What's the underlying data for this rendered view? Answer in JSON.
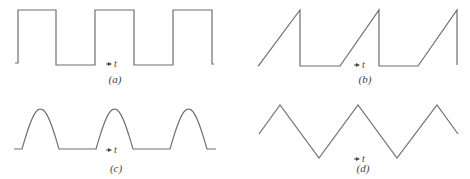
{
  "figure": {
    "panels": [
      {
        "id": "a",
        "label": "(a)",
        "waveform": "square",
        "axis_label": "t",
        "points": [
          [
            15,
            63
          ],
          [
            18,
            63
          ],
          [
            18,
            10
          ],
          [
            56,
            10
          ],
          [
            56,
            65
          ],
          [
            95,
            65
          ],
          [
            95,
            10
          ],
          [
            134,
            10
          ],
          [
            134,
            65
          ],
          [
            173,
            65
          ],
          [
            173,
            10
          ],
          [
            212,
            10
          ],
          [
            212,
            64
          ],
          [
            214,
            64
          ]
        ],
        "arrow": {
          "x1": 106,
          "x2": 112,
          "y": 64
        },
        "t_pos": {
          "x": 114,
          "y": 67
        },
        "label_pos": {
          "x": 115,
          "y": 83
        }
      },
      {
        "id": "b",
        "label": "(b)",
        "waveform": "sawtooth",
        "axis_label": "t",
        "points": [
          [
            258,
            66
          ],
          [
            259,
            65
          ],
          [
            300,
            10
          ],
          [
            300,
            66
          ],
          [
            340,
            66
          ],
          [
            379,
            10
          ],
          [
            379,
            66
          ],
          [
            418,
            66
          ],
          [
            457,
            10
          ],
          [
            457,
            65
          ]
        ],
        "arrow": {
          "x1": 354,
          "x2": 360,
          "y": 65
        },
        "t_pos": {
          "x": 362,
          "y": 68
        },
        "label_pos": {
          "x": 365,
          "y": 83
        }
      },
      {
        "id": "c",
        "label": "(c)",
        "waveform": "half-wave rectified sine",
        "axis_label": "t",
        "baseline_y": 149,
        "peak_y": 109,
        "humps": [
          [
            22,
            59
          ],
          [
            96,
            133
          ],
          [
            170,
            207
          ]
        ],
        "stubs": [
          [
            14,
            22
          ],
          [
            59,
            96
          ],
          [
            133,
            170
          ],
          [
            207,
            216
          ]
        ],
        "arrow": {
          "x1": 106,
          "x2": 112,
          "y": 150
        },
        "t_pos": {
          "x": 114,
          "y": 153
        },
        "label_pos": {
          "x": 116,
          "y": 172
        }
      },
      {
        "id": "d",
        "label": "(d)",
        "waveform": "triangle",
        "axis_label": "t",
        "points": [
          [
            259,
            134
          ],
          [
            280,
            105
          ],
          [
            319,
            158
          ],
          [
            358,
            105
          ],
          [
            397,
            158
          ],
          [
            437,
            105
          ],
          [
            458,
            134
          ]
        ],
        "arrow": {
          "x1": 354,
          "x2": 360,
          "y": 159
        },
        "t_pos": {
          "x": 362,
          "y": 162
        },
        "label_pos": {
          "x": 363,
          "y": 172
        }
      }
    ],
    "colors": {
      "line": "#6e6e6e",
      "text": "#444444"
    }
  }
}
